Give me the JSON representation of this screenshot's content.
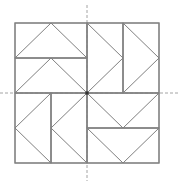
{
  "diagram": {
    "grid": {
      "columns": 4,
      "rows": 4
    },
    "colors": {
      "line": "#808080",
      "axis": "#9a9a9a",
      "center": "#333333",
      "background": "#ffffff"
    },
    "quadrants": [
      {
        "name": "top-left",
        "rect_orientation": "horizontal",
        "triangle_direction": "up",
        "rects": [
          [
            0,
            0,
            4,
            2
          ],
          [
            0,
            2,
            4,
            2
          ]
        ],
        "note": "units in half-cells of a 8x8 lattice"
      },
      {
        "name": "top-right",
        "rect_orientation": "vertical",
        "triangle_direction": "right"
      },
      {
        "name": "bottom-left",
        "rect_orientation": "vertical",
        "triangle_direction": "left"
      },
      {
        "name": "bottom-right",
        "rect_orientation": "horizontal",
        "triangle_direction": "down"
      }
    ],
    "rectangles": [
      {
        "id": "tl-1",
        "cells": [
          0,
          0,
          2,
          1
        ]
      },
      {
        "id": "tl-2",
        "cells": [
          0,
          1,
          2,
          1
        ]
      },
      {
        "id": "tr-1",
        "cells": [
          2,
          0,
          1,
          2
        ]
      },
      {
        "id": "tr-2",
        "cells": [
          3,
          0,
          1,
          2
        ]
      },
      {
        "id": "bl-1",
        "cells": [
          0,
          2,
          1,
          2
        ]
      },
      {
        "id": "bl-2",
        "cells": [
          1,
          2,
          1,
          2
        ]
      },
      {
        "id": "br-1",
        "cells": [
          2,
          2,
          2,
          1
        ]
      },
      {
        "id": "br-2",
        "cells": [
          2,
          3,
          2,
          1
        ]
      }
    ],
    "triangles": [
      {
        "id": "tl-1",
        "points": [
          [
            0,
            1
          ],
          [
            1,
            0
          ],
          [
            2,
            1
          ]
        ]
      },
      {
        "id": "tl-2",
        "points": [
          [
            0,
            2
          ],
          [
            1,
            1
          ],
          [
            2,
            2
          ]
        ]
      },
      {
        "id": "tr-1",
        "points": [
          [
            2,
            0
          ],
          [
            3,
            1
          ],
          [
            2,
            2
          ]
        ]
      },
      {
        "id": "tr-2",
        "points": [
          [
            3,
            0
          ],
          [
            4,
            1
          ],
          [
            3,
            2
          ]
        ]
      },
      {
        "id": "bl-1",
        "points": [
          [
            1,
            2
          ],
          [
            0,
            3
          ],
          [
            1,
            4
          ]
        ]
      },
      {
        "id": "bl-2",
        "points": [
          [
            2,
            2
          ],
          [
            1,
            3
          ],
          [
            2,
            4
          ]
        ]
      },
      {
        "id": "br-1",
        "points": [
          [
            2,
            2
          ],
          [
            3,
            3
          ],
          [
            4,
            2
          ]
        ]
      },
      {
        "id": "br-2",
        "points": [
          [
            2,
            3
          ],
          [
            3,
            4
          ],
          [
            4,
            3
          ]
        ]
      }
    ],
    "axes": [
      "vertical-center",
      "horizontal-center"
    ],
    "center_marker": true
  }
}
